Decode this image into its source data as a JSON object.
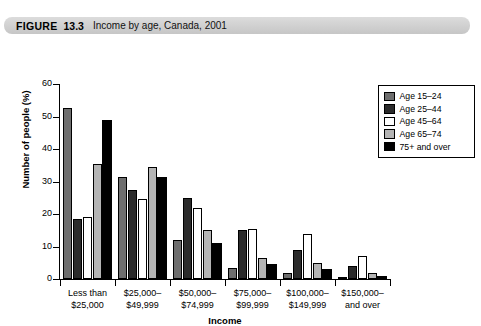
{
  "figure": {
    "label": "FIGURE",
    "number": "13.3",
    "title": "Income by age, Canada, 2001"
  },
  "chart_data": {
    "type": "bar",
    "title": "Income by age, Canada, 2001",
    "xlabel": "Income",
    "ylabel": "Number of people (%)",
    "ylim": [
      0,
      60
    ],
    "yticks": [
      0,
      10,
      20,
      30,
      40,
      50,
      60
    ],
    "grid": false,
    "legend_position": "top-right",
    "categories": [
      "Less than $25,000",
      "$25,000–$49,999",
      "$50,000–$74,999",
      "$75,000–$99,999",
      "$100,000–$149,999",
      "$150,000– and over"
    ],
    "category_lines": [
      [
        "Less than",
        "$25,000"
      ],
      [
        "$25,000–",
        "$49,999"
      ],
      [
        "$50,000–",
        "$74,999"
      ],
      [
        "$75,000–",
        "$99,999"
      ],
      [
        "$100,000–",
        "$149,999"
      ],
      [
        "$150,000–",
        "and over"
      ]
    ],
    "series": [
      {
        "name": "Age 15–24",
        "color": "#6e6e6e",
        "values": [
          52.5,
          31.5,
          12.0,
          3.5,
          2.0,
          0.7
        ]
      },
      {
        "name": "Age 25–44",
        "color": "#2b2b2b",
        "values": [
          18.5,
          27.5,
          25.0,
          15.0,
          9.0,
          4.0
        ]
      },
      {
        "name": "Age 45–64",
        "color": "#ffffff",
        "values": [
          19.0,
          24.5,
          22.0,
          15.5,
          14.0,
          7.0
        ]
      },
      {
        "name": "Age 65–74",
        "color": "#b4b4b4",
        "values": [
          35.5,
          34.5,
          15.0,
          6.5,
          5.0,
          2.0
        ]
      },
      {
        "name": "75+ and over",
        "color": "#000000",
        "values": [
          49.0,
          31.5,
          11.0,
          4.5,
          3.0,
          1.0
        ]
      }
    ]
  }
}
